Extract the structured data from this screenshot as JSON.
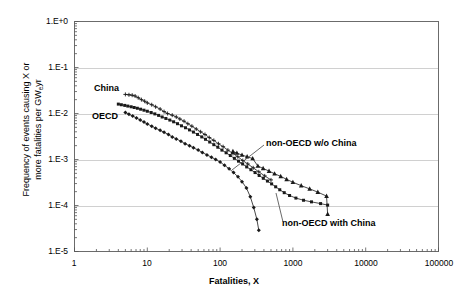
{
  "chart_data": {
    "type": "line",
    "title": "",
    "xlabel": "Fatalities, X",
    "ylabel_line1": "Frequency of events causing X or",
    "ylabel_line2": "more fatalities per GW",
    "ylabel_sub": "e",
    "ylabel_line2_tail": "yr",
    "xscale": "log",
    "yscale": "log",
    "xlim": [
      1,
      100000
    ],
    "ylim": [
      1e-05,
      1
    ],
    "grid": true,
    "legend_position": "inline-annotations",
    "xticks": [
      "1",
      "10",
      "100",
      "1000",
      "10000",
      "100000"
    ],
    "xtick_values": [
      1,
      10,
      100,
      1000,
      10000,
      100000
    ],
    "yticks": [
      "1.E+0",
      "1.E-1",
      "1.E-2",
      "1.E-3",
      "1.E-4",
      "1.E-5"
    ],
    "ytick_values": [
      1,
      0.1,
      0.01,
      0.001,
      0.0001,
      1e-05
    ],
    "annotations": [
      {
        "id": "china",
        "text": "China"
      },
      {
        "id": "oecd",
        "text": "OECD"
      },
      {
        "id": "non_oecd_wo_china",
        "text": "non-OECD w/o China"
      },
      {
        "id": "non_oecd_with_china",
        "text": "non-OECD with China"
      }
    ],
    "series": [
      {
        "name": "China",
        "marker": "plus-dot",
        "points": [
          [
            5,
            0.026
          ],
          [
            5.6,
            0.0255
          ],
          [
            6.2,
            0.025
          ],
          [
            6.8,
            0.024
          ],
          [
            7.5,
            0.022
          ],
          [
            8.3,
            0.02
          ],
          [
            9.2,
            0.0185
          ],
          [
            10,
            0.017
          ],
          [
            11.5,
            0.0155
          ],
          [
            13,
            0.014
          ],
          [
            15,
            0.0125
          ],
          [
            17,
            0.011
          ],
          [
            19,
            0.01
          ],
          [
            22,
            0.0092
          ],
          [
            25,
            0.0084
          ],
          [
            28,
            0.0076
          ],
          [
            32,
            0.0068
          ],
          [
            36,
            0.006
          ],
          [
            41,
            0.0053
          ],
          [
            47,
            0.0046
          ],
          [
            54,
            0.004
          ],
          [
            62,
            0.0035
          ],
          [
            71,
            0.003
          ],
          [
            82,
            0.0026
          ],
          [
            95,
            0.0022
          ],
          [
            110,
            0.0019
          ],
          [
            128,
            0.0016
          ],
          [
            150,
            0.00135
          ],
          [
            175,
            0.00115
          ],
          [
            205,
            0.00095
          ],
          [
            240,
            0.0008
          ],
          [
            285,
            0.00066
          ],
          [
            340,
            0.00054
          ],
          [
            410,
            0.00044
          ],
          [
            500,
            0.00036
          ]
        ]
      },
      {
        "name": "OECD",
        "marker": "filled-diamond",
        "points": [
          [
            5,
            0.0105
          ],
          [
            5.6,
            0.0096
          ],
          [
            6.3,
            0.0088
          ],
          [
            7.1,
            0.008
          ],
          [
            8,
            0.0072
          ],
          [
            9,
            0.0065
          ],
          [
            10,
            0.0059
          ],
          [
            11.5,
            0.0053
          ],
          [
            13,
            0.0048
          ],
          [
            15,
            0.0043
          ],
          [
            17,
            0.0039
          ],
          [
            19.5,
            0.0035
          ],
          [
            22,
            0.0031
          ],
          [
            25,
            0.0028
          ],
          [
            29,
            0.0025
          ],
          [
            33,
            0.0022
          ],
          [
            38,
            0.002
          ],
          [
            43,
            0.0018
          ],
          [
            50,
            0.0016
          ],
          [
            57,
            0.00142
          ],
          [
            66,
            0.00126
          ],
          [
            76,
            0.00112
          ],
          [
            87,
            0.001
          ],
          [
            100,
            0.00088
          ],
          [
            115,
            0.00075
          ],
          [
            133,
            0.00063
          ],
          [
            153,
            0.00052
          ],
          [
            176,
            0.00042
          ],
          [
            200,
            0.00033
          ],
          [
            230,
            0.00024
          ],
          [
            260,
            0.000155
          ],
          [
            290,
            9e-05
          ],
          [
            320,
            5e-05
          ],
          [
            340,
            2.9e-05
          ]
        ]
      },
      {
        "name": "non-OECD w/o China",
        "marker": "filled-square",
        "points": [
          [
            4,
            0.016
          ],
          [
            4.4,
            0.0155
          ],
          [
            4.9,
            0.015
          ],
          [
            5.4,
            0.0145
          ],
          [
            6,
            0.014
          ],
          [
            6.6,
            0.0135
          ],
          [
            7.3,
            0.013
          ],
          [
            8.1,
            0.0124
          ],
          [
            9,
            0.0118
          ],
          [
            10,
            0.0112
          ],
          [
            11.3,
            0.0105
          ],
          [
            12.7,
            0.0098
          ],
          [
            14.3,
            0.0091
          ],
          [
            16,
            0.0084
          ],
          [
            18,
            0.0078
          ],
          [
            20.4,
            0.0072
          ],
          [
            23,
            0.0066
          ],
          [
            26,
            0.006
          ],
          [
            29.5,
            0.0054
          ],
          [
            33.5,
            0.0049
          ],
          [
            38,
            0.0044
          ],
          [
            43,
            0.00395
          ],
          [
            49,
            0.0035
          ],
          [
            56,
            0.0031
          ],
          [
            63,
            0.00275
          ],
          [
            72,
            0.0024
          ],
          [
            82,
            0.0021
          ],
          [
            93,
            0.00185
          ],
          [
            106,
            0.0016
          ],
          [
            121,
            0.0014
          ],
          [
            138,
            0.00122
          ],
          [
            157,
            0.00106
          ],
          [
            179,
            0.00092
          ],
          [
            204,
            0.0008
          ],
          [
            232,
            0.00069
          ],
          [
            265,
            0.0006
          ],
          [
            302,
            0.00052
          ],
          [
            344,
            0.00045
          ],
          [
            392,
            0.00039
          ],
          [
            447,
            0.00034
          ],
          [
            510,
            0.000295
          ],
          [
            580,
            0.000255
          ],
          [
            660,
            0.00022
          ],
          [
            760,
            0.00019
          ],
          [
            900,
            0.000165
          ],
          [
            1100,
            0.000145
          ],
          [
            1400,
            0.00013
          ],
          [
            1800,
            0.00012
          ],
          [
            2400,
            0.00011
          ],
          [
            3000,
            0.000102
          ]
        ]
      },
      {
        "name": "non-OECD with China",
        "marker": "filled-triangle",
        "points": [
          [
            150,
            0.0015
          ],
          [
            170,
            0.00138
          ],
          [
            200,
            0.00125
          ],
          [
            235,
            0.00115
          ],
          [
            280,
            0.00105
          ],
          [
            330,
            0.00072
          ],
          [
            390,
            0.00064
          ],
          [
            470,
            0.00056
          ],
          [
            560,
            0.00049
          ],
          [
            680,
            0.00043
          ],
          [
            820,
            0.00037
          ],
          [
            1000,
            0.00032
          ],
          [
            1300,
            0.00027
          ],
          [
            1700,
            0.00023
          ],
          [
            2200,
            0.000195
          ],
          [
            2900,
            0.00016
          ],
          [
            3000,
            6.5e-05
          ]
        ]
      }
    ]
  }
}
